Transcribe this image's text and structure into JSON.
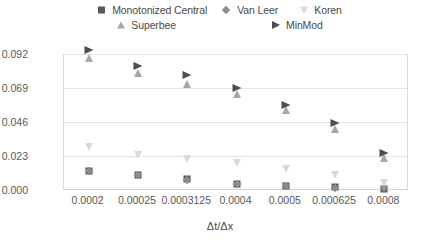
{
  "chart_data": {
    "type": "scatter",
    "title": "",
    "xlabel": "Δt/Δx",
    "ylabel": "Maximum error",
    "categories": [
      "0.0002",
      "0.00025",
      "0.0003125",
      "0.0004",
      "0.0005",
      "0.000625",
      "0.0008"
    ],
    "x_tick_labels": [
      "0.0002",
      "0.00025",
      "0.0003125",
      "0.0004",
      "0.0005",
      "0.000625",
      "0.0008"
    ],
    "y_tick_labels": [
      "0.000",
      "0.023",
      "0.046",
      "0.069",
      "0.092"
    ],
    "y_tick_values": [
      0.0,
      0.023,
      0.046,
      0.069,
      0.092
    ],
    "ylim": [
      0.0,
      0.092
    ],
    "grid": true,
    "legend_position": "top",
    "series": [
      {
        "name": "Monotonized Central",
        "marker": "square",
        "color": "#595959",
        "values": [
          0.013,
          0.0103,
          0.0072,
          0.004,
          0.0028,
          0.0018,
          0.001
        ]
      },
      {
        "name": "Van Leer",
        "marker": "diamond",
        "color": "#8c8c8c",
        "values": [
          0.0128,
          0.01,
          0.007,
          0.0038,
          0.0026,
          0.0016,
          0.0012
        ]
      },
      {
        "name": "Koren",
        "marker": "triangle-down",
        "color": "#d9d9d9",
        "values": [
          0.029,
          0.024,
          0.021,
          0.018,
          0.014,
          0.01,
          0.005
        ]
      },
      {
        "name": "Superbee",
        "marker": "triangle-up",
        "color": "#a6a6a6",
        "values": [
          0.089,
          0.079,
          0.072,
          0.065,
          0.054,
          0.041,
          0.0215
        ]
      },
      {
        "name": "MinMod",
        "marker": "triangle-right",
        "color": "#4d4d4d",
        "values": [
          0.095,
          0.084,
          0.078,
          0.069,
          0.0575,
          0.045,
          0.025
        ]
      }
    ]
  },
  "legend": {
    "rows": [
      [
        {
          "label": "Monotonized Central",
          "marker": "square-marker"
        },
        {
          "label": "Van Leer",
          "marker": "diamond-marker"
        },
        {
          "label": "Koren",
          "marker": "triangle-down-marker"
        }
      ],
      [
        {
          "label": "Superbee",
          "marker": "triangle-up-marker"
        },
        {
          "label": "MinMod",
          "marker": "triangle-right-marker"
        }
      ]
    ]
  }
}
